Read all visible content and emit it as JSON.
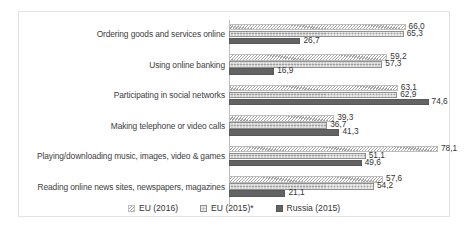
{
  "chart_data": {
    "type": "bar",
    "orientation": "horizontal",
    "title": "",
    "subtitle": "",
    "xlabel": "",
    "ylabel": "",
    "xlim": [
      0,
      80
    ],
    "grid": false,
    "legend_position": "bottom-center",
    "categories": [
      "Ordering goods and services online",
      "Using online banking",
      "Participating in social networks",
      "Making telephone or video calls",
      "Playing/downloading music, images, video & games",
      "Reading online news sites, newspapers, magazines"
    ],
    "series": [
      {
        "name": "EU (2016)",
        "pattern": "diagonal-hatch",
        "color": "#a6a6a6",
        "values": [
          66.0,
          59.2,
          63.1,
          39.3,
          78.1,
          57.6
        ],
        "labels": [
          "66,0",
          "59,2",
          "63,1",
          "39,3",
          "78,1",
          "57,6"
        ]
      },
      {
        "name": "EU (2015)*",
        "pattern": "stipple",
        "color": "#9d9d9d",
        "values": [
          65.3,
          57.3,
          62.9,
          36.7,
          51.1,
          54.2
        ],
        "labels": [
          "65,3",
          "57,3",
          "62,9",
          "36,7",
          "51,1",
          "54,2"
        ]
      },
      {
        "name": "Russia (2015)",
        "pattern": "solid",
        "color": "#636363",
        "values": [
          26.7,
          16.9,
          74.6,
          41.3,
          49.6,
          21.1
        ],
        "labels": [
          "26,7",
          "16,9",
          "74,6",
          "41,3",
          "49,6",
          "21,1"
        ]
      }
    ]
  },
  "legend": {
    "items": [
      {
        "label": "EU (2016)"
      },
      {
        "label": "EU (2015)*"
      },
      {
        "label": "Russia (2015)"
      }
    ]
  }
}
